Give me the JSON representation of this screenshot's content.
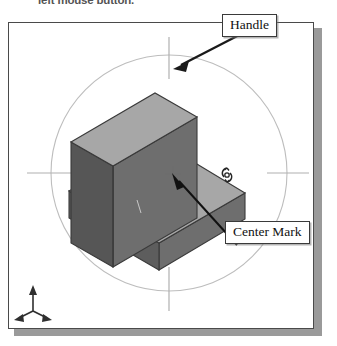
{
  "page": {
    "caption": "left mouse button.",
    "width": 337,
    "height": 346
  },
  "figure": {
    "name": "isometric-solid-rotation-view",
    "background": "#ffffff",
    "border_color": "#4a4a4a",
    "shadow_color": "#9a9a9a"
  },
  "callouts": [
    {
      "id": "handle",
      "label": "Handle",
      "target": "rotation-handle-tick-top"
    },
    {
      "id": "center-mark",
      "label": "Center Mark",
      "target": "rotation-center-cross"
    }
  ],
  "solid": {
    "name": "l-shaped-block",
    "faces": {
      "top_face_color": "#a8a8a8",
      "front_face_color": "#5e5e5e",
      "side_face_color": "#707070",
      "edge_color": "#3c3c3c"
    }
  },
  "rotation_ring": {
    "name": "rotation-handle-circle",
    "stroke": "#b4b4b4",
    "cx": 160,
    "cy": 150,
    "r": 118,
    "ticks": [
      "top",
      "right",
      "bottom",
      "left"
    ]
  },
  "center_mark": {
    "name": "center-cross",
    "x": 164,
    "y": 151,
    "color": "#6a6a6a"
  },
  "axis_triad": {
    "name": "coordinate-axis-triad",
    "color": "#2f2f2f",
    "axes": [
      "z-up",
      "x-right",
      "y-left"
    ]
  },
  "cursor": {
    "name": "rotate-cursor",
    "glyph": "rotate-3d",
    "color": "#2a2a2a"
  }
}
